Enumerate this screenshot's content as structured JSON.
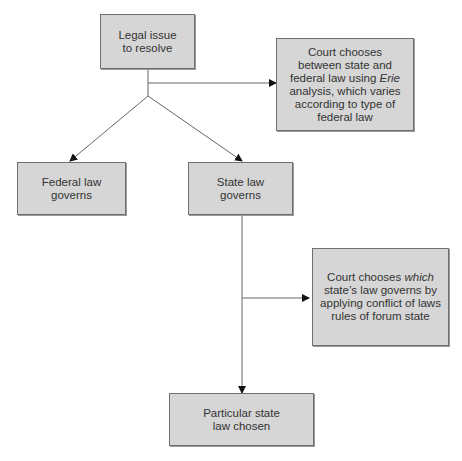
{
  "diagram": {
    "nodes": {
      "legal_issue": {
        "line1": "Legal issue",
        "line2": "to resolve"
      },
      "erie": {
        "line1": "Court chooses",
        "line2": "between state and",
        "line3_pre": "federal law using ",
        "line3_em": "Erie",
        "line4": "analysis, which varies",
        "line5": "according to type of",
        "line6": "federal law"
      },
      "federal": {
        "line1": "Federal law",
        "line2": "governs"
      },
      "state": {
        "line1": "State law",
        "line2": "governs"
      },
      "conflict": {
        "line1_pre": "Court chooses ",
        "line1_em": "which",
        "line2": "state’s law governs by",
        "line3": "applying conflict of laws",
        "line4": "rules of forum state"
      },
      "particular": {
        "line1": "Particular state",
        "line2": "law chosen"
      }
    },
    "colors": {
      "box_fill": "#d6d6d6",
      "box_border": "#6f6f6f",
      "line": "#666666",
      "text": "#333333"
    }
  }
}
